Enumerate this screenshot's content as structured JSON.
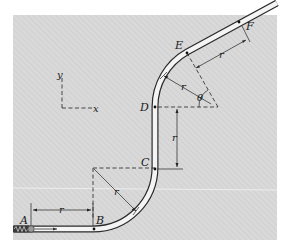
{
  "figure": {
    "background": "#ffffff",
    "panel_color": "#d9d9d9",
    "hatch_color": "#cfcfcf",
    "tube_outline": "#2a2a2a",
    "tube_fill": "#f4f4f4",
    "line_color": "#222222"
  },
  "axes": {
    "y_label": "y",
    "x_label": "x"
  },
  "points": {
    "A": "A",
    "B": "B",
    "C": "C",
    "D": "D",
    "E": "E",
    "F": "F"
  },
  "dimensions": {
    "r_AB": "r",
    "r_bottom_radius": "r",
    "r_CD": "r",
    "r_top_radius": "r",
    "r_EF": "r",
    "theta": "θ"
  }
}
